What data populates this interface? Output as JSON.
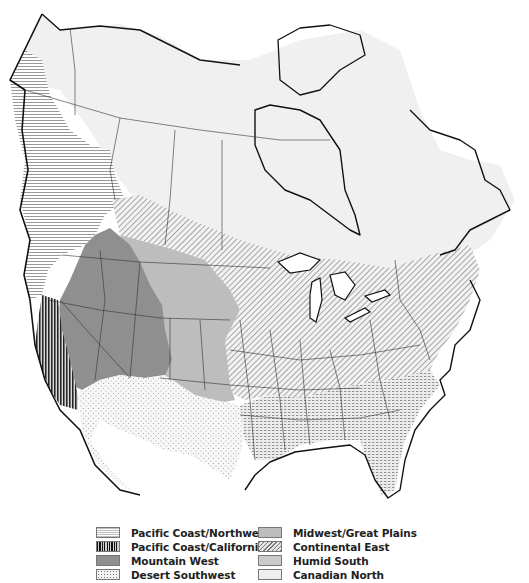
{
  "map": {
    "title": "North American regions",
    "regions": [
      {
        "id": "pacific-coast-northwest",
        "label": "Pacific Coast/Northwest",
        "pattern": "horizontal-lines",
        "color": "#bdbdbd"
      },
      {
        "id": "pacific-coast-california",
        "label": "Pacific Coast/California",
        "pattern": "vertical-lines-dark",
        "color": "#111111"
      },
      {
        "id": "mountain-west",
        "label": "Mountain West",
        "pattern": "solid-dark-gray",
        "color": "#8f8f8f"
      },
      {
        "id": "desert-southwest",
        "label": "Desert Southwest",
        "pattern": "sparse-dots",
        "color": "#f3f3f3"
      },
      {
        "id": "midwest-great-plains",
        "label": "Midwest/Great Plains",
        "pattern": "solid-mid-gray",
        "color": "#bdbdbd"
      },
      {
        "id": "continental-east",
        "label": "Continental East",
        "pattern": "diagonal-lines",
        "color": "#777777"
      },
      {
        "id": "humid-south",
        "label": "Humid South",
        "pattern": "dense-dots-dashes",
        "color": "#e0e0e0"
      },
      {
        "id": "canadian-north",
        "label": "Canadian North",
        "pattern": "solid-light-gray",
        "color": "#eeeeee"
      }
    ]
  },
  "legend": {
    "col1": [
      {
        "label": "Pacific Coast/Northwest"
      },
      {
        "label": "Pacific Coast/California"
      },
      {
        "label": "Mountain West"
      },
      {
        "label": "Desert Southwest"
      }
    ],
    "col2": [
      {
        "label": "Midwest/Great Plains"
      },
      {
        "label": "Continental East"
      },
      {
        "label": "Humid South"
      },
      {
        "label": "Canadian North"
      }
    ]
  }
}
